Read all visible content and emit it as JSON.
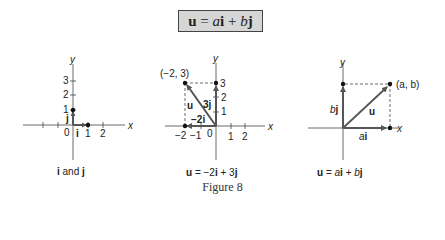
{
  "formula_box": {
    "u": "u",
    "eq": " = ",
    "a": "a",
    "i": "i",
    "plus": " + ",
    "b": "b",
    "j": "j"
  },
  "panels": [
    {
      "name": "unit-vectors",
      "caption": {
        "i": "i",
        "and": " and ",
        "j": "j"
      },
      "axis_labels": {
        "x": "x",
        "y": "y"
      },
      "x_ticks": [
        "0",
        "1",
        "2"
      ],
      "y_ticks": [
        "1",
        "2",
        "3"
      ],
      "vector_labels": {
        "i": "i",
        "j": "j"
      }
    },
    {
      "name": "example-vector",
      "caption": {
        "u": "u",
        "rest1": " = −2",
        "i": "i",
        "rest2": " + 3",
        "j": "j"
      },
      "axis_labels": {
        "x": "x",
        "y": "y"
      },
      "x_ticks": [
        "−2",
        "−1",
        "0",
        "1",
        "2"
      ],
      "y_ticks": [
        "1",
        "2",
        "3"
      ],
      "point_label": "(−2, 3)",
      "vector_labels": {
        "u": "u",
        "horizontal": "−2i",
        "vertical": "3j"
      }
    },
    {
      "name": "general-vector",
      "caption": {
        "u": "u",
        "eq": " = ",
        "a": "a",
        "i": "i",
        "plus": " + ",
        "b": "b",
        "j": "j"
      },
      "axis_labels": {
        "x": "x",
        "y": "y"
      },
      "point_label": "(a, b)",
      "vector_labels": {
        "u": "u",
        "horizontal_coef": "a",
        "horizontal_vec": "i",
        "vertical_coef": "b",
        "vertical_vec": "j"
      }
    }
  ],
  "figure_caption": "Figure 8"
}
